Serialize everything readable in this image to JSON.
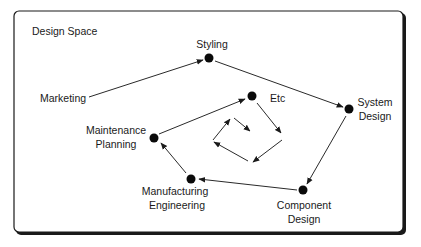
{
  "diagram": {
    "title": "Design Space",
    "frame": {
      "border_color": "#1a1a1a",
      "background": "#ffffff"
    },
    "nodes": {
      "styling": {
        "label": "Styling"
      },
      "system_design": {
        "label_line1": "System",
        "label_line2": "Design"
      },
      "component_design": {
        "label_line1": "Component",
        "label_line2": "Design"
      },
      "manufacturing_engineering": {
        "label_line1": "Manufacturing",
        "label_line2": "Engineering"
      },
      "maintenance_planning": {
        "label_line1": "Maintenance",
        "label_line2": "Planning"
      },
      "etc": {
        "label": "Etc"
      },
      "marketing": {
        "label": "Marketing"
      }
    },
    "edges": [
      {
        "from": "Marketing",
        "to": "Styling"
      },
      {
        "from": "Styling",
        "to": "System Design"
      },
      {
        "from": "System Design",
        "to": "Component Design"
      },
      {
        "from": "Component Design",
        "to": "Manufacturing Engineering"
      },
      {
        "from": "Manufacturing Engineering",
        "to": "Maintenance Planning"
      },
      {
        "from": "Maintenance Planning",
        "to": "Etc"
      },
      {
        "from": "Etc",
        "to": "inward spiral"
      }
    ]
  }
}
